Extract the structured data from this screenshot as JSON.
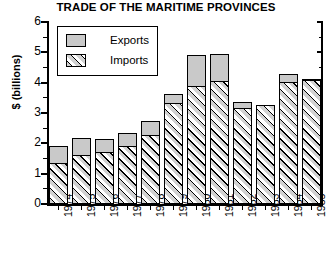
{
  "chart_data": {
    "type": "bar",
    "subtype": "stacked-vertical",
    "title": "TRADE OF THE MARITIME PROVINCES",
    "subtitle": "",
    "xlabel": "",
    "ylabel": "$ (billions)",
    "ylim": [
      0,
      6
    ],
    "ytick_labels": [
      "0",
      "1",
      "2",
      "3",
      "4",
      "5",
      "6"
    ],
    "ytick_values": [
      0,
      1,
      2,
      3,
      4,
      5,
      6
    ],
    "yminor_step": 0.5,
    "grid": false,
    "legend_position": "top-left-inside",
    "categories": [
      "1974",
      "1975",
      "1976",
      "1977",
      "1978",
      "1979",
      "1980",
      "1981",
      "1982",
      "1983",
      "1984",
      "1985"
    ],
    "series": [
      {
        "name": "Imports",
        "stack_order": 0,
        "pattern": "diagonal-hatch",
        "values": [
          1.35,
          1.6,
          1.7,
          1.92,
          2.27,
          3.33,
          3.88,
          4.06,
          3.17,
          3.27,
          4.03,
          4.09
        ]
      },
      {
        "name": "Exports",
        "stack_order": 1,
        "pattern": "solid-gray",
        "values": [
          0.55,
          0.58,
          0.45,
          0.43,
          0.45,
          0.28,
          1.02,
          0.87,
          0.19,
          0.0,
          0.26,
          0.04
        ]
      }
    ],
    "totals": [
      1.9,
      2.18,
      2.15,
      2.35,
      2.72,
      3.61,
      4.9,
      4.93,
      3.36,
      3.27,
      4.29,
      4.13
    ],
    "annotations": []
  },
  "legend": {
    "items": [
      {
        "label": "Exports",
        "swatch": "solid-gray-swatch"
      },
      {
        "label": "Imports",
        "swatch": "diagonal-hatch-swatch"
      }
    ]
  },
  "colors": {
    "exports_fill": "#c9c9c9",
    "imports_fill": "#d2d2d2",
    "axis": "#000000",
    "background": "#ffffff"
  }
}
